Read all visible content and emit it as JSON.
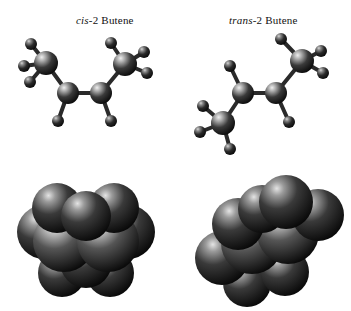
{
  "figure": {
    "background_color": "#ffffff",
    "style": "grayscale molecular models",
    "columns": [
      {
        "id": "cis",
        "label_prefix": "cis",
        "label_suffix": "-2 Butene",
        "label_full": "cis-2 Butene",
        "ball_stick_caption": "cis-2-butene ball-and-stick model",
        "space_fill_caption": "cis-2-butene space-filling model"
      },
      {
        "id": "trans",
        "label_prefix": "trans",
        "label_suffix": "-2 Butene",
        "label_full": "trans-2 Butene",
        "ball_stick_caption": "trans-2-butene ball-and-stick model",
        "space_fill_caption": "trans-2-butene space-filling model"
      }
    ]
  },
  "colors": {
    "carbon_dark": "#1b1b1b",
    "carbon_mid": "#4a4a4a",
    "carbon_light": "#d8d8d8",
    "hydrogen_dark": "#161616",
    "hydrogen_light": "#bdbdbd",
    "bond": "#2a2a2a",
    "outline": "#000000",
    "text": "#111111"
  },
  "models": {
    "cis_ball_stick": {
      "type": "ball-and-stick",
      "description": "Two methyl carbons angled upward on the same side of the C=C axis; two hydrogens point downward from the double-bonded carbons.",
      "atoms": [
        {
          "element": "C",
          "role": "methyl-left",
          "x": 46,
          "y": 63,
          "r": 12
        },
        {
          "element": "C",
          "role": "alkene-left",
          "x": 68,
          "y": 93,
          "r": 11
        },
        {
          "element": "C",
          "role": "alkene-right",
          "x": 101,
          "y": 93,
          "r": 11
        },
        {
          "element": "C",
          "role": "methyl-right",
          "x": 125,
          "y": 64,
          "r": 12
        },
        {
          "element": "H",
          "x": 31,
          "y": 44,
          "r": 6
        },
        {
          "element": "H",
          "x": 24,
          "y": 66,
          "r": 6
        },
        {
          "element": "H",
          "x": 30,
          "y": 82,
          "r": 6
        },
        {
          "element": "H",
          "x": 58,
          "y": 121,
          "r": 6
        },
        {
          "element": "H",
          "x": 111,
          "y": 121,
          "r": 6
        },
        {
          "element": "H",
          "x": 111,
          "y": 43,
          "r": 6
        },
        {
          "element": "H",
          "x": 144,
          "y": 52,
          "r": 6
        },
        {
          "element": "H",
          "x": 147,
          "y": 73,
          "r": 6
        }
      ]
    },
    "trans_ball_stick": {
      "type": "ball-and-stick",
      "description": "Zigzag chain: one methyl group points to the upper right, the other to the lower left, on opposite sides of the C=C axis.",
      "atoms": [
        {
          "element": "C",
          "role": "methyl-upper-right",
          "x": 302,
          "y": 61,
          "r": 12
        },
        {
          "element": "C",
          "role": "alkene-right",
          "x": 276,
          "y": 93,
          "r": 11
        },
        {
          "element": "C",
          "role": "alkene-left",
          "x": 243,
          "y": 93,
          "r": 11
        },
        {
          "element": "C",
          "role": "methyl-lower-left",
          "x": 223,
          "y": 123,
          "r": 12
        },
        {
          "element": "H",
          "x": 281,
          "y": 39,
          "r": 6
        },
        {
          "element": "H",
          "x": 321,
          "y": 51,
          "r": 6
        },
        {
          "element": "H",
          "x": 323,
          "y": 73,
          "r": 6
        },
        {
          "element": "H",
          "x": 289,
          "y": 122,
          "r": 6
        },
        {
          "element": "H",
          "x": 230,
          "y": 66,
          "r": 6
        },
        {
          "element": "H",
          "x": 203,
          "y": 106,
          "r": 6
        },
        {
          "element": "H",
          "x": 200,
          "y": 132,
          "r": 6
        },
        {
          "element": "H",
          "x": 230,
          "y": 149,
          "r": 6
        }
      ]
    },
    "cis_space_fill": {
      "type": "space-filling",
      "description": "Compact, left-right symmetric cluster of overlapping spheres.",
      "spheres": [
        {
          "element": "H",
          "x": 44,
          "y": 232,
          "r": 27
        },
        {
          "element": "H",
          "x": 128,
          "y": 232,
          "r": 27
        },
        {
          "element": "H",
          "x": 57,
          "y": 206,
          "r": 25
        },
        {
          "element": "H",
          "x": 114,
          "y": 206,
          "r": 25
        },
        {
          "element": "H",
          "x": 62,
          "y": 273,
          "r": 24
        },
        {
          "element": "H",
          "x": 110,
          "y": 273,
          "r": 24
        },
        {
          "element": "C",
          "x": 64,
          "y": 241,
          "r": 31
        },
        {
          "element": "C",
          "x": 108,
          "y": 241,
          "r": 31
        },
        {
          "element": "H",
          "x": 86,
          "y": 215,
          "r": 25
        },
        {
          "element": "C",
          "x": 86,
          "y": 250,
          "r": 29
        }
      ]
    },
    "trans_space_fill": {
      "type": "space-filling",
      "description": "Extended diagonal arrangement of overlapping spheres running from lower left to upper right.",
      "spheres": [
        {
          "element": "H",
          "x": 222,
          "y": 258,
          "r": 27
        },
        {
          "element": "H",
          "x": 238,
          "y": 224,
          "r": 26
        },
        {
          "element": "H",
          "x": 247,
          "y": 283,
          "r": 24
        },
        {
          "element": "C",
          "x": 252,
          "y": 243,
          "r": 31
        },
        {
          "element": "H",
          "x": 286,
          "y": 204,
          "r": 27
        },
        {
          "element": "C",
          "x": 288,
          "y": 233,
          "r": 31
        },
        {
          "element": "H",
          "x": 318,
          "y": 215,
          "r": 26
        },
        {
          "element": "H",
          "x": 300,
          "y": 265,
          "r": 24
        },
        {
          "element": "H",
          "x": 262,
          "y": 208,
          "r": 24
        }
      ]
    }
  }
}
